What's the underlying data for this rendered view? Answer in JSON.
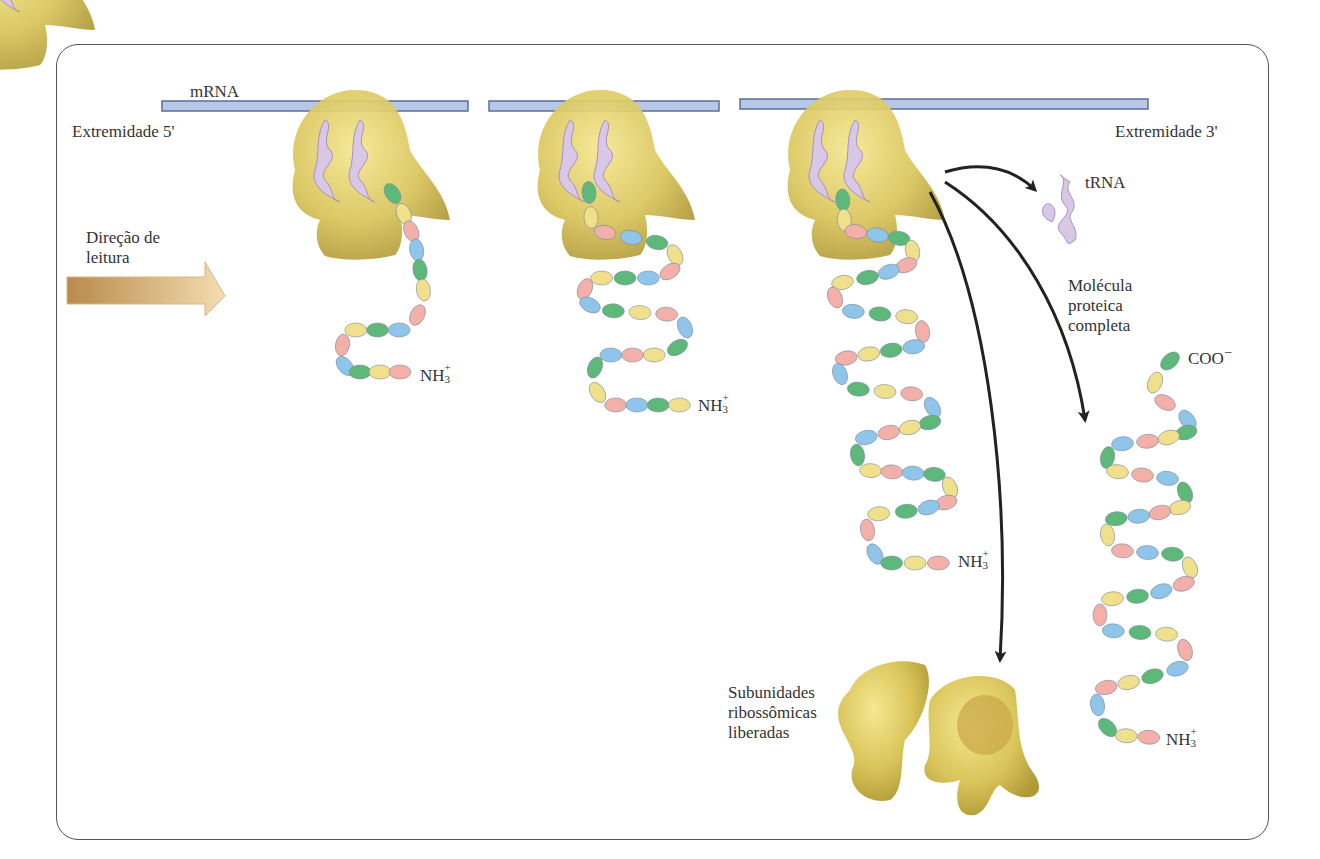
{
  "diagram": {
    "labels": {
      "mrna": "mRNA",
      "end5": "Extremidade  5'",
      "end3": "Extremidade 3'",
      "direction_line1": "Direção de",
      "direction_line2": "leitura",
      "trna": "tRNA",
      "protein_line1": "Molécula",
      "protein_line2": "proteica",
      "protein_line3": "completa",
      "subunits_line1": "Subunidades",
      "subunits_line2": "ribossômicas",
      "subunits_line3": "liberadas",
      "nh3": "NH",
      "nh3_sub": "3",
      "nh3_sup": "+",
      "coo": "COO",
      "coo_sup": "−"
    },
    "colors": {
      "mrna_fill": "#b7c8e6",
      "mrna_stroke": "#5a6f9c",
      "ribosome": "#d8c25a",
      "ribosome_light": "#f2e48a",
      "trna": "#c8b8d8",
      "bead_blue": "#8fc5e8",
      "bead_pink": "#f2b0a8",
      "bead_green": "#5eb87a",
      "bead_yellow": "#f0e08c",
      "arrow_gold": "#c9a060",
      "arrow_black": "#222222"
    },
    "stages": [
      {
        "name": "stage-1",
        "ribosome_x": 355
      },
      {
        "name": "stage-2",
        "ribosome_x": 600
      },
      {
        "name": "stage-3",
        "ribosome_x": 850
      }
    ]
  }
}
